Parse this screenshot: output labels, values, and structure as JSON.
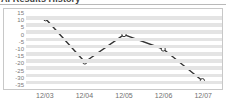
{
  "header": {
    "title": "AI Results History",
    "title_clipped": true
  },
  "chart_data": {
    "type": "line",
    "title": "AI Results History",
    "xlabel": "",
    "ylabel": "",
    "categories": [
      "12/03",
      "12/04",
      "12/05",
      "12/06",
      "12/07"
    ],
    "series": [
      {
        "name": "Result",
        "values": [
          11,
          -19,
          0,
          -10,
          -32
        ]
      }
    ],
    "ylim": [
      -35,
      15
    ],
    "yticks": [
      15,
      10,
      5,
      0,
      -5,
      -10,
      -15,
      -20,
      -25,
      -30,
      -35
    ],
    "ytick_labels": [
      "15",
      "10",
      "5",
      "0",
      "-5",
      "-10",
      "-15",
      "-20",
      "-25",
      "-30",
      "-35"
    ],
    "grid": true,
    "grid_style": "alternating-horizontal-bands",
    "legend": "none",
    "marker": "open-circle",
    "colors": {
      "line": "#333333",
      "marker_fill": "#ffffff",
      "marker_stroke": "#333333",
      "band": "#e4e4e4",
      "plot_background": "#ffffff",
      "frame_border": "#c8c8c8",
      "tick_text": "#787878"
    }
  }
}
